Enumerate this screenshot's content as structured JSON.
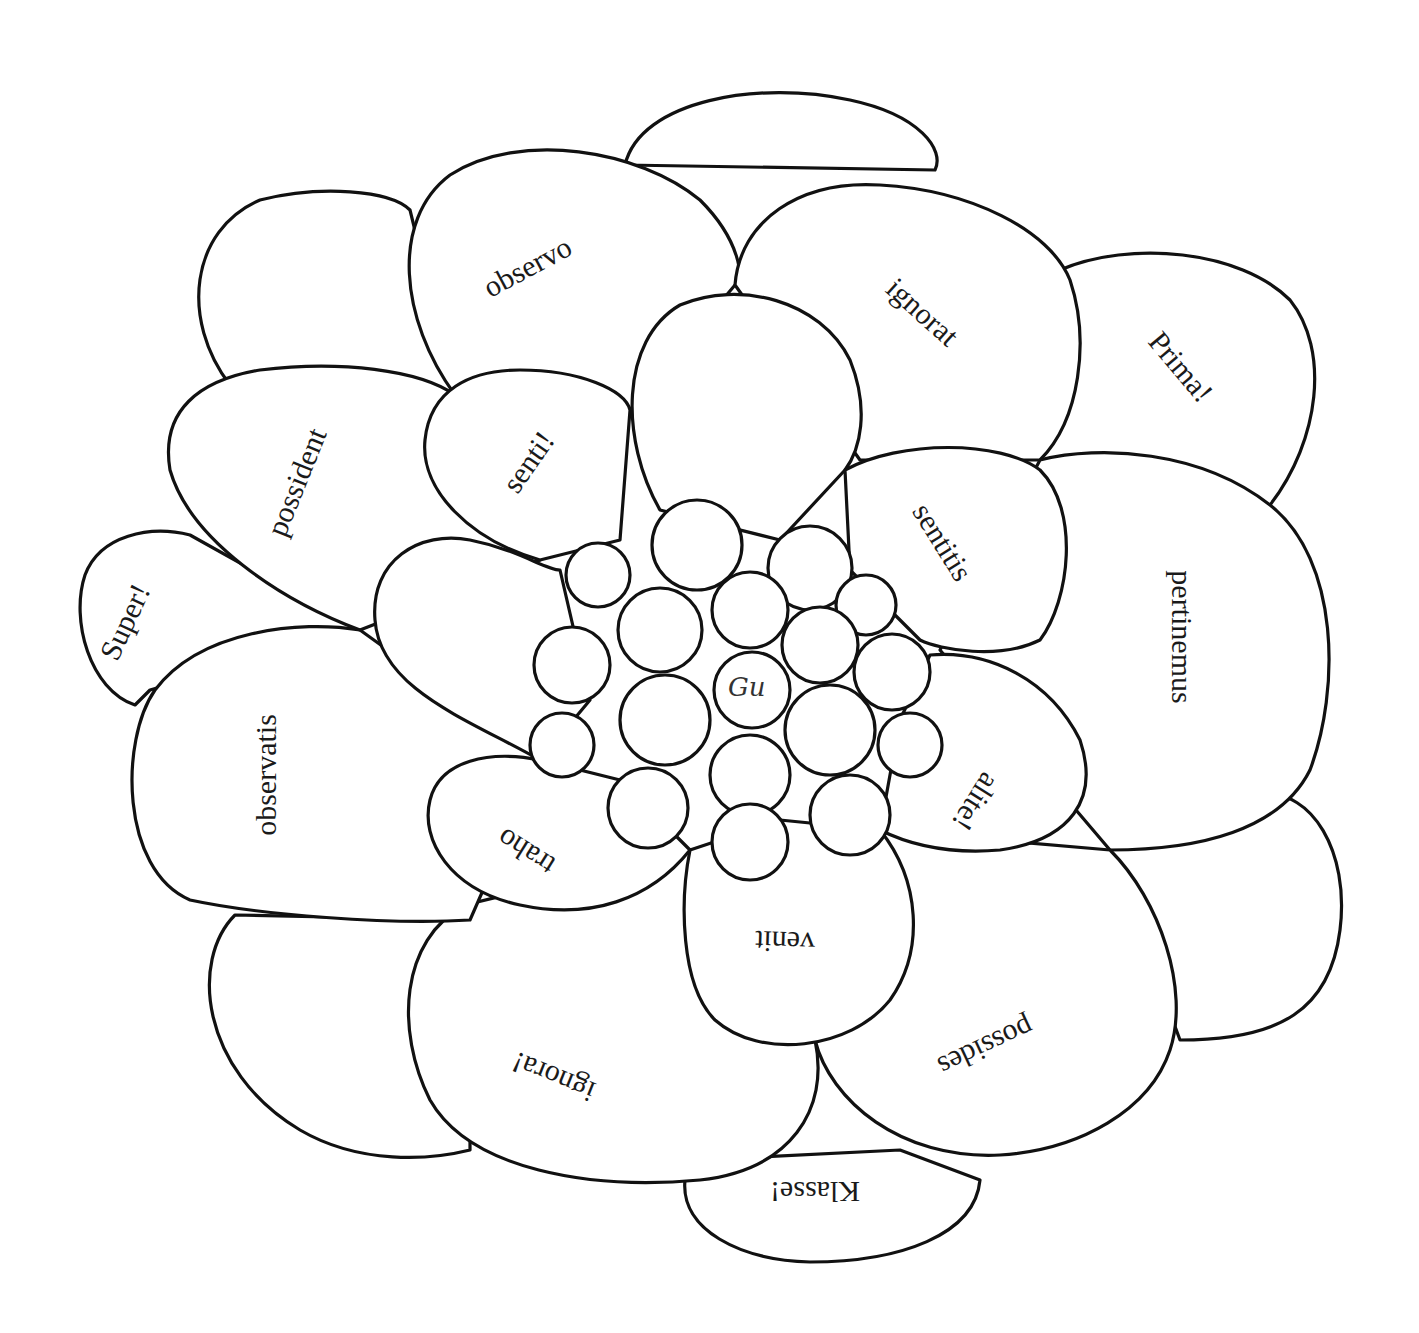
{
  "worksheet": {
    "type": "flower word-petal puzzle",
    "outer_petals": [
      "Prima!",
      "Super!",
      "Klasse!"
    ],
    "middle_petals": [
      "observo",
      "ignorat",
      "pertinemus",
      "possides",
      "ignora!",
      "observatis",
      "possident"
    ],
    "inner_petals": [
      "senti!",
      "sentitis",
      "alite!",
      "venit",
      "traho"
    ],
    "center_signature": "Gu",
    "colors": {
      "line": "#111111",
      "background": "#ffffff",
      "text": "#1a1a1a"
    }
  }
}
